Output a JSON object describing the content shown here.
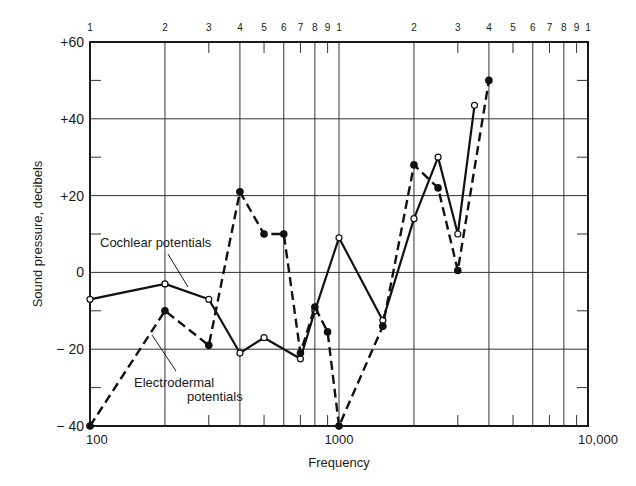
{
  "chart_data": {
    "type": "line",
    "title": "",
    "xlabel": "Frequency",
    "ylabel": "Sound pressure, decibels",
    "xscale": "log",
    "xlim": [
      100,
      10000
    ],
    "ylim": [
      -40,
      60
    ],
    "grid": true,
    "x_tick_labels": [
      "100",
      "1000",
      "10,000"
    ],
    "x_tick_values": [
      100,
      1000,
      10000
    ],
    "top_tick_labels": [
      "1",
      "2",
      "3",
      "4",
      "5",
      "6",
      "7",
      "8",
      "9",
      "1",
      "2",
      "3",
      "4",
      "5",
      "6",
      "7",
      "8",
      "9",
      "1"
    ],
    "y_tick_labels": [
      "+60",
      "+40",
      "+20",
      "0",
      "− 20",
      "− 40"
    ],
    "y_tick_values": [
      60,
      40,
      20,
      0,
      -20,
      -40
    ],
    "series": [
      {
        "name": "Cochlear potentials",
        "style": "solid",
        "marker": "open-circle",
        "x": [
          100,
          200,
          300,
          400,
          500,
          700,
          800,
          1000,
          1500,
          2000,
          2500,
          3000,
          3500
        ],
        "values": [
          -7,
          -3,
          -7,
          -21,
          -17,
          -22.5,
          -10,
          9,
          -12.5,
          14,
          30,
          10,
          43.5
        ]
      },
      {
        "name": "Electrodermal potentials",
        "style": "dashed",
        "marker": "filled-circle",
        "x": [
          100,
          200,
          300,
          400,
          500,
          600,
          700,
          800,
          900,
          1000,
          1500,
          2000,
          2500,
          3000,
          4000
        ],
        "values": [
          -40,
          -10,
          -19,
          21,
          10,
          10,
          -21,
          -9,
          -15.5,
          -40,
          -14,
          28,
          22,
          0.5,
          50
        ]
      }
    ],
    "annotations": [
      {
        "text": "Cochlear potentials",
        "points_to": "Cochlear potentials"
      },
      {
        "text": "Electrodermal potentials",
        "points_to": "Electrodermal potentials"
      }
    ]
  },
  "labels": {
    "xlabel": "Frequency",
    "ylabel": "Sound pressure, decibels",
    "cochlear_annotation": "Cochlear potentials",
    "electro_line1": "Electrodermal",
    "electro_line2": "potentials"
  }
}
